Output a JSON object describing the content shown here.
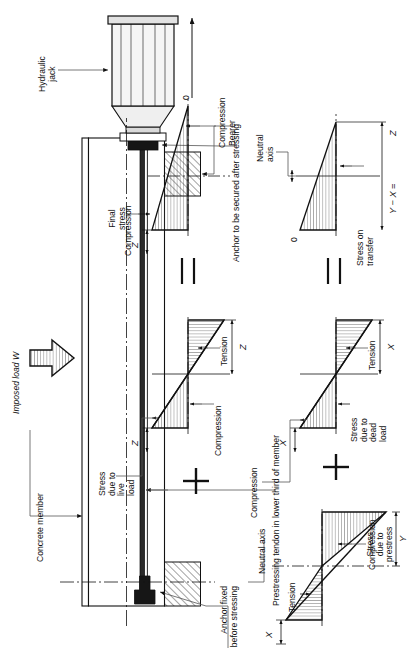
{
  "figure": {
    "type": "engineering-diagram",
    "caption": ""
  },
  "member_diagram": {
    "labels": {
      "hydraulic_jack": "Hydraulic\njack",
      "bearer": "Bearer",
      "concrete_member": "Concrete member",
      "imposed_load": "Imposed load W",
      "anchor_fixed": "Anchor fixed\nbefore stressing",
      "anchor_secured": "Anchor to be secured after stressing",
      "prestressing_tendon": "Prestressing tendon in lower third of member",
      "neutral_axis": "Neutral axis"
    }
  },
  "stress_diagrams": [
    {
      "id": "prestress",
      "title": "Stress\ndue to\nprestress",
      "top_label": "Tension",
      "bottom_label": "Compression",
      "dim_top": "X",
      "dim_bottom": "Y",
      "shape": "linear-varying, tension at top, compression at bottom"
    },
    {
      "id": "dead-load",
      "title": "Stress\ndue to\ndead\nload",
      "top_label": "Compression",
      "bottom_label": "Tension",
      "dim_top": "X",
      "dim_bottom": "X",
      "shape": "linear-varying, compression at top, tension at bottom"
    },
    {
      "id": "transfer",
      "title": "Stress on\ntransfer",
      "top_label": "Compression",
      "bottom_label": "",
      "zero_label": "0",
      "axis_label": "Neutral\naxis",
      "dim_bottom": "Y − X =",
      "dim_value": "Z",
      "shape": "triangular, zero at top, maximum compression at bottom"
    },
    {
      "id": "live-load",
      "title": "Stress\ndue to\nlive\nload",
      "top_label": "Compression",
      "bottom_label": "Tension",
      "dim_top": "Z",
      "dim_bottom": "Z",
      "shape": "linear-varying, compression at top, tension at bottom"
    },
    {
      "id": "final",
      "title": "Final\nstress",
      "top_label": "Compression",
      "bottom_label": "Compression",
      "zero_label": "0",
      "dim_top": "Z",
      "shape": "triangular, maximum compression at top, zero at bottom"
    }
  ],
  "operators": {
    "plus_1": "+",
    "equals_1": "=",
    "plus_2": "+",
    "equals_2": "="
  },
  "colors": {
    "line": "#111111",
    "hatch": "#333333",
    "leader": "#555555",
    "background": "#ffffff"
  }
}
